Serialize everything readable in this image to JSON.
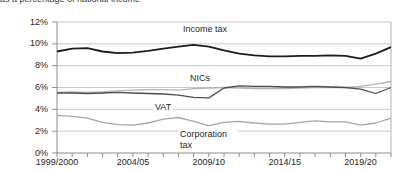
{
  "cropped_header": {
    "text": "as a percentage of national income"
  },
  "chart_data": {
    "type": "line",
    "title": "",
    "xlabel": "",
    "ylabel": "",
    "grid": true,
    "ylim": [
      0,
      12
    ],
    "y_tick_labels": [
      "12%",
      "10%",
      "8%",
      "6%",
      "4%",
      "2%",
      "0%"
    ],
    "y_tick_values": [
      12,
      10,
      8,
      6,
      4,
      2,
      0
    ],
    "x_tick_labels": [
      "1999/2000",
      "2004/05",
      "2009/10",
      "2014/15",
      "2019/20"
    ],
    "x_tick_year_indices": [
      0,
      5,
      10,
      15,
      20
    ],
    "n_points": 23,
    "x_range_note": "annual fiscal years starting 1999/2000",
    "legend_position": "inline-labels",
    "series": [
      {
        "name": "Income tax",
        "color": "#1c1c1c",
        "width": 1.8,
        "values": [
          9.3,
          9.55,
          9.6,
          9.3,
          9.15,
          9.2,
          9.35,
          9.55,
          9.75,
          9.9,
          9.75,
          9.4,
          9.1,
          8.95,
          8.85,
          8.85,
          8.9,
          8.9,
          8.95,
          8.9,
          8.65,
          9.1,
          9.7
        ]
      },
      {
        "name": "NICs",
        "color": "#b3b3b3",
        "width": 1.3,
        "values": [
          5.55,
          5.6,
          5.55,
          5.6,
          5.7,
          5.75,
          5.8,
          5.8,
          5.75,
          5.9,
          5.95,
          6.0,
          5.95,
          5.9,
          5.9,
          5.9,
          5.95,
          6.0,
          6.0,
          6.0,
          6.1,
          6.3,
          6.55
        ]
      },
      {
        "name": "VAT",
        "color": "#4d4d4d",
        "width": 1.3,
        "values": [
          5.5,
          5.5,
          5.45,
          5.5,
          5.55,
          5.5,
          5.45,
          5.4,
          5.3,
          5.1,
          5.05,
          5.95,
          6.15,
          6.1,
          6.1,
          6.05,
          6.05,
          6.1,
          6.05,
          6.0,
          5.85,
          5.45,
          6.0
        ]
      },
      {
        "name": "Corporation tax",
        "color": "#a6a6a6",
        "width": 1.3,
        "values": [
          3.45,
          3.35,
          3.2,
          2.8,
          2.6,
          2.55,
          2.75,
          3.1,
          3.25,
          2.9,
          2.5,
          2.8,
          2.9,
          2.75,
          2.65,
          2.65,
          2.8,
          2.95,
          2.85,
          2.85,
          2.55,
          2.75,
          3.2
        ]
      }
    ],
    "colors": {
      "gridline": "#c9c9c9",
      "axis": "#8c8c8c",
      "plot_right_border": "#b3b3b3",
      "text": "#262626"
    }
  }
}
